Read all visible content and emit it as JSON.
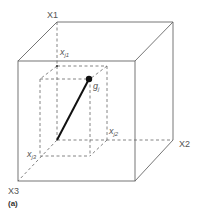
{
  "diagram": {
    "caption": "(a)",
    "axes": {
      "x1": "X1",
      "x2": "X2",
      "x3": "X3"
    },
    "coordinates": {
      "xj1_base": "x",
      "xj1_sub": "j1",
      "xj2_base": "x",
      "xj2_sub": "j2",
      "xj3_base": "x",
      "xj3_sub": "j3"
    },
    "point": {
      "base": "g",
      "sub": "j"
    },
    "colors": {
      "outer_cube": "#555555",
      "dashed": "#555555",
      "vector": "#111111",
      "point": "#111111"
    }
  }
}
